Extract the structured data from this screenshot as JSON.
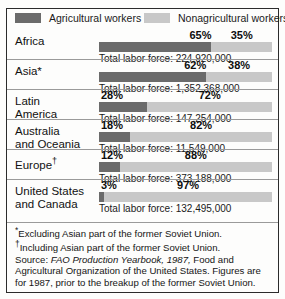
{
  "chart_data": {
    "type": "bar",
    "subtype": "100% stacked horizontal bar",
    "title": "",
    "xlabel": "",
    "ylabel": "",
    "xlim": [
      0,
      100
    ],
    "grid": false,
    "legend_position": "top",
    "categories": [
      "Africa",
      "Asia*",
      "Latin America",
      "Australia and Oceania",
      "Europe†",
      "United States and Canada"
    ],
    "series": [
      {
        "name": "Agricultural workers",
        "values": [
          65,
          62,
          28,
          18,
          12,
          3
        ],
        "color": "#6b6b6b"
      },
      {
        "name": "Nonagricultural workers",
        "values": [
          35,
          38,
          72,
          82,
          88,
          97
        ],
        "color": "#c8c8c8"
      }
    ],
    "annotations": [
      "Total labor force: 224,920,000",
      "Total labor force: 1,352,368,000",
      "Total labor force: 147,254,000",
      "Total labor force: 11,549,000",
      "Total labor force: 373,188,000",
      "Total labor force: 132,495,000"
    ]
  },
  "legend": {
    "agricultural": {
      "label": "Agricultural workers",
      "color": "#6b6b6b"
    },
    "nonagricultural": {
      "label": "Nonagricultural workers",
      "color": "#c8c8c8"
    }
  },
  "rows": [
    {
      "region_line1": "Africa",
      "region_line2": "",
      "marker": "",
      "ag_pct": "65%",
      "nonag_pct": "35%",
      "ag_value": 65,
      "nonag_value": 35,
      "total": "Total labor force: 224,920,000"
    },
    {
      "region_line1": "Asia*",
      "region_line2": "",
      "marker": "",
      "ag_pct": "62%",
      "nonag_pct": "38%",
      "ag_value": 62,
      "nonag_value": 38,
      "total": "Total labor force: 1,352,368,000"
    },
    {
      "region_line1": "Latin",
      "region_line2": "America",
      "marker": "",
      "ag_pct": "28%",
      "nonag_pct": "72%",
      "ag_value": 28,
      "nonag_value": 72,
      "total": "Total labor force: 147,254,000"
    },
    {
      "region_line1": "Australia",
      "region_line2": "and Oceania",
      "marker": "",
      "ag_pct": "18%",
      "nonag_pct": "82%",
      "ag_value": 18,
      "nonag_value": 82,
      "total": "Total labor force: 11,549,000"
    },
    {
      "region_line1": "Europe",
      "region_line2": "",
      "marker": "†",
      "ag_pct": "12%",
      "nonag_pct": "88%",
      "ag_value": 12,
      "nonag_value": 88,
      "total": "Total labor force: 373,188,000"
    },
    {
      "region_line1": "United States",
      "region_line2": "and Canada",
      "marker": "",
      "ag_pct": "3%",
      "nonag_pct": "97%",
      "ag_value": 3,
      "nonag_value": 97,
      "total": "Total labor force: 132,495,000"
    }
  ],
  "footnotes": {
    "star_mark": "*",
    "star_text": "Excluding Asian part of the former Soviet Union.",
    "dagger_mark": "†",
    "dagger_text": "Including Asian part of the former Soviet Union.",
    "source_prefix": "Source:",
    "source_italic": "FAO Production Yearbook, 1987,",
    "source_rest": " Food and Agricultural Organization of the United States. Figures are for 1987, prior to the breakup of the former Soviet Union."
  }
}
